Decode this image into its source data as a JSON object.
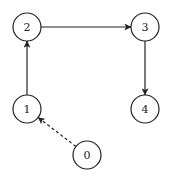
{
  "diagram": {
    "type": "directed-graph",
    "colors": {
      "stroke": "#222222",
      "fill": "#ffffff",
      "background": "#ffffff"
    },
    "nodes": [
      {
        "id": "0",
        "label": "0",
        "x": 87,
        "y": 155,
        "r": 14
      },
      {
        "id": "1",
        "label": "1",
        "x": 27,
        "y": 109,
        "r": 14
      },
      {
        "id": "2",
        "label": "2",
        "x": 27,
        "y": 27,
        "r": 14
      },
      {
        "id": "3",
        "label": "3",
        "x": 145,
        "y": 27,
        "r": 14
      },
      {
        "id": "4",
        "label": "4",
        "x": 145,
        "y": 109,
        "r": 14
      }
    ],
    "edges": [
      {
        "from": "1",
        "to": "2",
        "style": "solid"
      },
      {
        "from": "2",
        "to": "3",
        "style": "solid"
      },
      {
        "from": "3",
        "to": "4",
        "style": "solid"
      },
      {
        "from": "0",
        "to": "1",
        "style": "dashed"
      }
    ]
  }
}
